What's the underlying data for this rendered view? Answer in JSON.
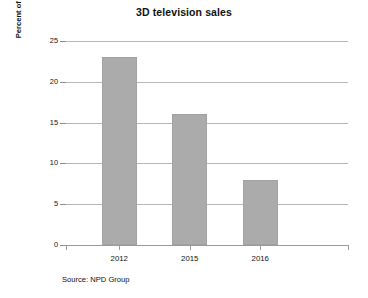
{
  "chart_data": {
    "type": "bar",
    "title": "3D television sales",
    "xlabel": "",
    "ylabel": "Percent of overall TV sales spending",
    "categories": [
      "2012",
      "2015",
      "2016"
    ],
    "values": [
      23,
      16,
      8
    ],
    "series": [
      {
        "name": "Percent of overall TV sales spending",
        "values": [
          23,
          16,
          8
        ]
      }
    ],
    "ylim": [
      0,
      25
    ],
    "yticks": [
      0,
      5,
      10,
      15,
      20,
      25
    ],
    "ytick_labels": [
      "0",
      "5",
      "10",
      "15",
      "20",
      "25"
    ],
    "grid": true,
    "legend": false,
    "legend_position": "none",
    "bar_color": "#ababab",
    "gridline_color": "#b7b7b7",
    "axis_color": "#9a9a9a",
    "background_color": "#ffffff",
    "annotations": [
      "Source: NPD Group"
    ]
  },
  "figure": {
    "title": "3D television sales",
    "source_note": "Source: NPD Group"
  },
  "axes": {
    "y": {
      "title": "Percent of overall TV sales spending",
      "ticks": [
        "0",
        "5",
        "10",
        "15",
        "20",
        "25"
      ]
    },
    "x": {
      "title": "",
      "ticks": [
        "2012",
        "2015",
        "2016"
      ]
    }
  }
}
